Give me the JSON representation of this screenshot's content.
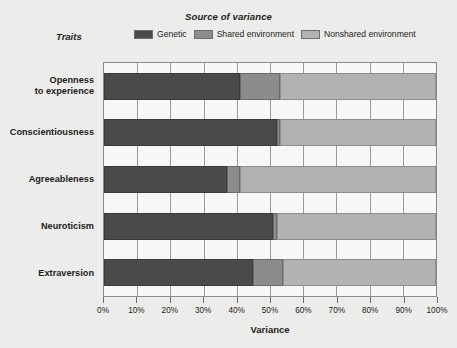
{
  "chart_data": {
    "type": "bar",
    "orientation": "horizontal",
    "stacked": true,
    "title": "Source of variance",
    "xlabel": "Variance",
    "ylabel": "Traits",
    "xlim": [
      0,
      100
    ],
    "grid": true,
    "legend_position": "top",
    "categories": [
      "Openness\nto experience",
      "Conscientiousness",
      "Agreeableness",
      "Neuroticism",
      "Extraversion"
    ],
    "category_lines": [
      [
        "Openness",
        "to experience"
      ],
      [
        "Conscientiousness"
      ],
      [
        "Agreeableness"
      ],
      [
        "Neuroticism"
      ],
      [
        "Extraversion"
      ]
    ],
    "series": [
      {
        "name": "Genetic",
        "color": "#4a4a4a",
        "values": [
          41,
          52,
          37,
          51,
          45
        ]
      },
      {
        "name": "Shared environment",
        "color": "#8c8c8c",
        "values": [
          12,
          1,
          4,
          1,
          9
        ]
      },
      {
        "name": "Nonshared environment",
        "color": "#b2b2b2",
        "values": [
          47,
          47,
          59,
          48,
          46
        ]
      }
    ],
    "xticks": [
      0,
      10,
      20,
      30,
      40,
      50,
      60,
      70,
      80,
      90,
      100
    ],
    "xticklabels": [
      "0%",
      "10%",
      "20%",
      "30%",
      "40%",
      "50%",
      "60%",
      "70%",
      "80%",
      "90%",
      "100%"
    ]
  },
  "legend": {
    "title": "Source of variance",
    "traits_label": "Traits",
    "items": [
      {
        "label": "Genetic",
        "color": "#4a4a4a"
      },
      {
        "label": "Shared environment",
        "color": "#8c8c8c"
      },
      {
        "label": "Nonshared environment",
        "color": "#b2b2b2"
      }
    ]
  },
  "axis": {
    "x_title": "Variance",
    "y_title": "Traits"
  }
}
